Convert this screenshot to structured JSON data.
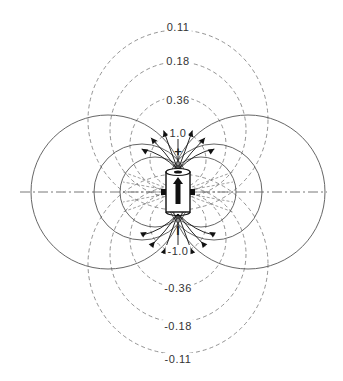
{
  "diagram": {
    "center": [
      178,
      192
    ],
    "positive_equipotentials": [
      {
        "label": "0.11",
        "label_pos": [
          178,
          28
        ],
        "cy": 120,
        "r": 90
      },
      {
        "label": "0.18",
        "label_pos": [
          178,
          62
        ],
        "cy": 130,
        "r": 68
      },
      {
        "label": "0.36",
        "label_pos": [
          178,
          101
        ],
        "cy": 145,
        "r": 48
      },
      {
        "label": "1.0",
        "label_pos": [
          178,
          134
        ],
        "cy": 160,
        "r": 28
      }
    ],
    "negative_equipotentials": [
      {
        "label": "-1.0",
        "label_pos": [
          178,
          252
        ],
        "cy": 224,
        "r": 28
      },
      {
        "label": "-0.36",
        "label_pos": [
          178,
          289
        ],
        "cy": 239,
        "r": 48
      },
      {
        "label": "-0.18",
        "label_pos": [
          178,
          327
        ],
        "cy": 254,
        "r": 68
      },
      {
        "label": "-0.11",
        "label_pos": [
          178,
          360
        ],
        "cy": 264,
        "r": 90
      }
    ],
    "field_lines_left": [
      {
        "cx": 108,
        "r": 77
      },
      {
        "cx": 142,
        "r": 48
      },
      {
        "cx": 155,
        "r": 35
      }
    ],
    "field_lines_right": [
      {
        "cx": 248,
        "r": 77
      },
      {
        "cx": 214,
        "r": 48
      },
      {
        "cx": 201,
        "r": 35
      }
    ],
    "poles": {
      "positive": "+",
      "negative": "I"
    },
    "axis": {
      "x1": 20,
      "x2": 327,
      "y": 192,
      "style": "dash-dot"
    },
    "colors": {
      "line": "#555555",
      "dashed": "#777777",
      "ink": "#111111"
    }
  }
}
